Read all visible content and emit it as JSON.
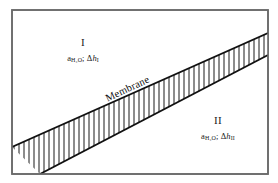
{
  "figure": {
    "background_color": "#ffffff",
    "frame_color": "#6b6b6b",
    "line_color": "#111111",
    "hatch_color": "#1a1a1a",
    "frame": {
      "x": 12,
      "y": 10,
      "width": 256,
      "height": 164
    }
  },
  "membrane": {
    "label": "Membrane",
    "rotation_deg": -25,
    "upper_edge": {
      "x1": 12,
      "y1": 147,
      "x2": 268,
      "y2": 33
    },
    "lower_edge": {
      "x1": 40,
      "y1": 174,
      "x2": 268,
      "y2": 55
    },
    "hatch_count": 48,
    "hatch_orientation": "vertical"
  },
  "regions": [
    {
      "id": "I",
      "roman": "I",
      "activity_symbol": "a",
      "activity_subscript": "H₂O",
      "separator": ";",
      "delta": "Δ",
      "head_var": "h",
      "head_subscript": "I"
    },
    {
      "id": "II",
      "roman": "II",
      "activity_symbol": "a",
      "activity_subscript": "H₂O",
      "separator": ";",
      "delta": "Δ",
      "head_var": "h",
      "head_subscript": "II"
    }
  ]
}
